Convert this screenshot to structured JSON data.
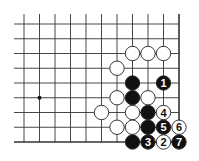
{
  "diagram": {
    "type": "go-board-fragment",
    "grid": {
      "cols": 11,
      "rows": 9,
      "x0": 24,
      "y0": 24,
      "dx": 15.5,
      "dy": 14.75,
      "right_edge": true,
      "bottom_edge": true
    },
    "hoshi": [
      {
        "col": 1,
        "row": 5
      }
    ],
    "stones": [
      {
        "col": 7,
        "row": 2,
        "color": "white",
        "label": ""
      },
      {
        "col": 8,
        "row": 2,
        "color": "white",
        "label": ""
      },
      {
        "col": 9,
        "row": 2,
        "color": "white",
        "label": ""
      },
      {
        "col": 6,
        "row": 3,
        "color": "white",
        "label": ""
      },
      {
        "col": 7,
        "row": 4,
        "color": "black",
        "label": ""
      },
      {
        "col": 9,
        "row": 4,
        "color": "black",
        "label": "1"
      },
      {
        "col": 6,
        "row": 5,
        "color": "white",
        "label": ""
      },
      {
        "col": 7,
        "row": 5,
        "color": "black",
        "label": ""
      },
      {
        "col": 8,
        "row": 5,
        "color": "white",
        "label": ""
      },
      {
        "col": 5,
        "row": 6,
        "color": "white",
        "label": ""
      },
      {
        "col": 7,
        "row": 6,
        "color": "white",
        "label": ""
      },
      {
        "col": 8,
        "row": 6,
        "color": "black",
        "label": ""
      },
      {
        "col": 9,
        "row": 6,
        "color": "white",
        "label": "4"
      },
      {
        "col": 6,
        "row": 7,
        "color": "white",
        "label": ""
      },
      {
        "col": 7,
        "row": 7,
        "color": "white",
        "label": ""
      },
      {
        "col": 8,
        "row": 7,
        "color": "black",
        "label": ""
      },
      {
        "col": 9,
        "row": 7,
        "color": "black",
        "label": "5"
      },
      {
        "col": 10,
        "row": 7,
        "color": "white",
        "label": "6"
      },
      {
        "col": 7,
        "row": 8,
        "color": "black",
        "label": ""
      },
      {
        "col": 8,
        "row": 8,
        "color": "black",
        "label": "3"
      },
      {
        "col": 9,
        "row": 8,
        "color": "white",
        "label": "2"
      },
      {
        "col": 10,
        "row": 8,
        "color": "black",
        "label": "7"
      }
    ],
    "colors": {
      "line": "#333333",
      "black_stone": "#111111",
      "white_stone": "#ffffff",
      "stone_outline": "#222222"
    }
  }
}
